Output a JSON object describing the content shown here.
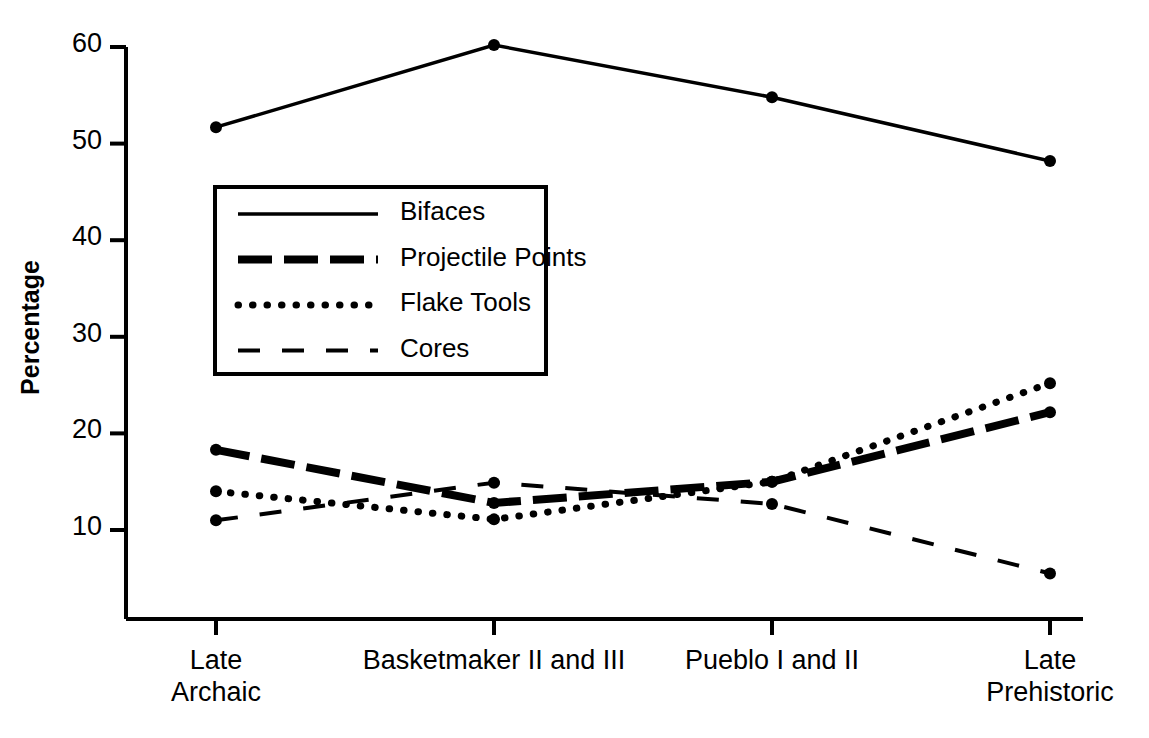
{
  "chart_data": {
    "type": "line",
    "title": "",
    "xlabel": "",
    "ylabel": "Percentage",
    "categories": [
      "Late\nArchaic",
      "Basketmaker II and III",
      "Pueblo I and II",
      "Late\nPrehistoric"
    ],
    "category_labels_flat": [
      "Late Archaic",
      "Basketmaker II and III",
      "Pueblo I and II",
      "Late Prehistoric"
    ],
    "ylim": [
      0,
      60
    ],
    "yticks": [
      10,
      20,
      30,
      40,
      50,
      60
    ],
    "ytick_labels": [
      "10",
      "20",
      "30",
      "40",
      "50",
      "60"
    ],
    "grid": false,
    "legend_position": "upper-left-inside",
    "series": [
      {
        "name": "Bifaces",
        "style": "solid",
        "values": [
          51.7,
          60.2,
          54.8,
          48.2
        ]
      },
      {
        "name": "Projectile Points",
        "style": "thick-dashed",
        "values": [
          18.3,
          12.8,
          15.0,
          22.2
        ]
      },
      {
        "name": "Flake Tools",
        "style": "dotted",
        "values": [
          14.0,
          11.1,
          15.0,
          25.2
        ]
      },
      {
        "name": "Cores",
        "style": "thin-dashed",
        "values": [
          11.0,
          14.9,
          12.7,
          5.5
        ]
      }
    ],
    "colors": {
      "line": "#000000",
      "axis": "#000000",
      "background": "#ffffff"
    }
  },
  "legend": {
    "items": [
      {
        "label": "Bifaces"
      },
      {
        "label": "Projectile Points"
      },
      {
        "label": "Flake Tools"
      },
      {
        "label": "Cores"
      }
    ]
  }
}
